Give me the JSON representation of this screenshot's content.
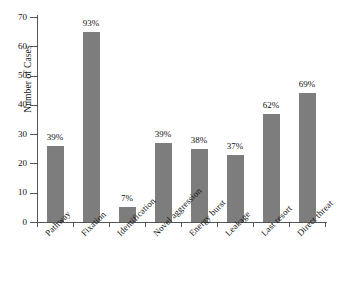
{
  "chart_data": {
    "type": "bar",
    "title": "",
    "xlabel": "",
    "ylabel": "Number of Cases",
    "ylim": [
      0,
      70
    ],
    "yticks": [
      0,
      10,
      20,
      30,
      40,
      50,
      60,
      70
    ],
    "grid": false,
    "legend": null,
    "bar_color": "#7d7d7d",
    "categories": [
      "Pathway",
      "Fixation",
      "Identification",
      "Novel aggression",
      "Energy burst",
      "Leakage",
      "Last resort",
      "Direct threat"
    ],
    "values": [
      26,
      65,
      5,
      27,
      25,
      23,
      37,
      44
    ],
    "data_labels": [
      "39%",
      "93%",
      "7%",
      "39%",
      "38%",
      "37%",
      "62%",
      "69%"
    ],
    "percentages": [
      39,
      93,
      7,
      39,
      38,
      37,
      62,
      69
    ]
  }
}
